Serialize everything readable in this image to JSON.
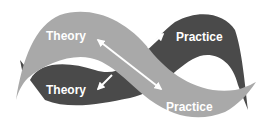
{
  "diagram": {
    "labels": {
      "theory_top": "Theory",
      "practice_top": "Practice",
      "theory_bottom": "Theory",
      "practice_bottom": "Practice"
    },
    "colors": {
      "light_ribbon": "#a9a9a9",
      "dark_ribbon": "#4a4a4a",
      "arrow": "#ffffff",
      "background": "#ffffff"
    }
  }
}
